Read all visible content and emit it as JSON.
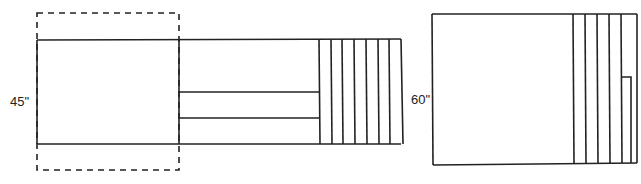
{
  "diagram": {
    "left_layout": {
      "height_label": "45\"",
      "pleats": 7
    },
    "right_layout": {
      "height_label": "60\"",
      "pleats": 5
    },
    "colors": {
      "line": "#222222",
      "background": "#ffffff"
    }
  }
}
